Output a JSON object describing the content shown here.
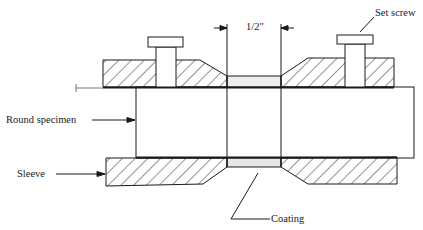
{
  "diagram": {
    "labels": {
      "dimension": "1/2\"",
      "set_screw": "Set screw",
      "round_specimen": "Round specimen",
      "sleeve": "Sleeve",
      "coating": "Coating"
    },
    "colors": {
      "line": "#1a1a1a",
      "hatch": "#2a2a2a",
      "coating_fill": "#e6e6e6",
      "background": "#ffffff"
    }
  }
}
